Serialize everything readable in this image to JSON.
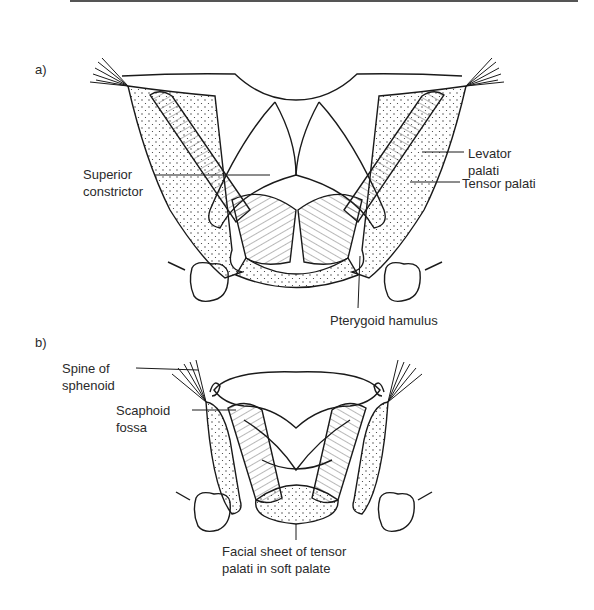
{
  "figure": {
    "panels": [
      {
        "id": "a",
        "label": "a)",
        "annotations": {
          "superior_constrictor": [
            "Superior",
            "constrictor"
          ],
          "levator_palati": [
            "Levator",
            "palati"
          ],
          "tensor_palati": "Tensor palati",
          "pterygoid_hamulus": "Pterygoid hamulus"
        }
      },
      {
        "id": "b",
        "label": "b)",
        "annotations": {
          "spine_of_sphenoid": [
            "Spine of",
            "sphenoid"
          ],
          "scaphoid_fossa": [
            "Scaphoid",
            "fossa"
          ],
          "facial_sheet": [
            "Facial sheet of tensor",
            "palati in soft palate"
          ]
        }
      }
    ]
  }
}
